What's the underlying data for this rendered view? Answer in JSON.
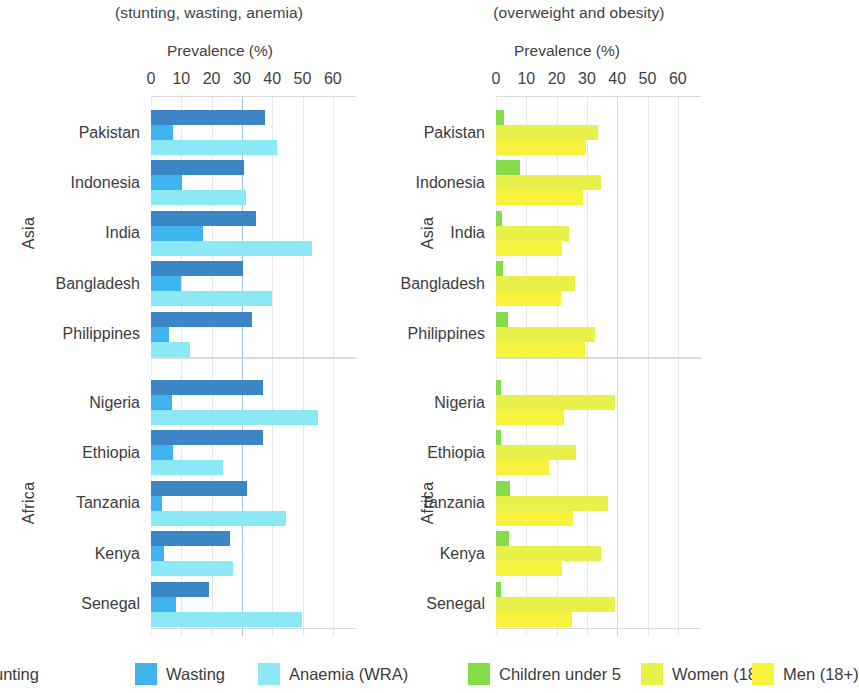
{
  "panels": {
    "left": {
      "subtitle": "(stunting, wasting, anemia)",
      "axis_title": "Prevalence (%)"
    },
    "right": {
      "subtitle": "(overweight and obesity)",
      "axis_title": "Prevalence (%)"
    }
  },
  "ticks": [
    "0",
    "10",
    "20",
    "30",
    "40",
    "50",
    "60"
  ],
  "regions": [
    {
      "label": "Asia",
      "countries": [
        "Pakistan",
        "Indonesia",
        "India",
        "Bangladesh",
        "Philippines"
      ]
    },
    {
      "label": "Africa",
      "countries": [
        "Nigeria",
        "Ethiopia",
        "Tanzania",
        "Kenya",
        "Senegal"
      ]
    }
  ],
  "legend": {
    "left": [
      {
        "name": "Stunting",
        "display": "unting",
        "color": "#3d86c6"
      },
      {
        "name": "Wasting",
        "display": "Wasting",
        "color": "#3fb3ee"
      },
      {
        "name": "Anaemia (WRA)",
        "display": "Anaemia (WRA)",
        "color": "#8de8f6"
      }
    ],
    "right": [
      {
        "name": "Children under 5",
        "display": "Children under 5",
        "color": "#84dd48"
      },
      {
        "name": "Women (18+)",
        "display": "Women (18+)",
        "color": "#e8f04a"
      },
      {
        "name": "Men (18+)",
        "display": "Men (18+)",
        "color": "#f7f23c"
      }
    ]
  },
  "chart_data": [
    {
      "type": "bar",
      "title": "Undernutrition (stunting, wasting, anemia)",
      "orientation": "horizontal",
      "xlabel": "Prevalence (%)",
      "ylabel": "",
      "xlim": [
        0,
        65
      ],
      "xticks": [
        0,
        10,
        20,
        30,
        40,
        50,
        60
      ],
      "grid": true,
      "legend_position": "bottom",
      "categories": [
        "Pakistan",
        "Indonesia",
        "India",
        "Bangladesh",
        "Philippines",
        "Nigeria",
        "Ethiopia",
        "Tanzania",
        "Kenya",
        "Senegal"
      ],
      "series": [
        {
          "name": "Stunting",
          "color": "#3d86c6",
          "values": [
            37.6,
            30.8,
            34.7,
            30.2,
            33.4,
            36.8,
            36.8,
            31.8,
            26.2,
            19.0
          ]
        },
        {
          "name": "Wasting",
          "color": "#3fb3ee",
          "values": [
            7.1,
            10.2,
            17.3,
            9.8,
            5.8,
            6.8,
            7.2,
            3.5,
            4.2,
            8.1
          ]
        },
        {
          "name": "Anaemia (WRA)",
          "color": "#8de8f6",
          "values": [
            41.7,
            31.2,
            53.0,
            39.9,
            12.8,
            55.1,
            23.8,
            44.6,
            27.2,
            49.9
          ]
        }
      ]
    },
    {
      "type": "bar",
      "title": "Overnutrition (overweight and obesity)",
      "orientation": "horizontal",
      "xlabel": "Prevalence (%)",
      "ylabel": "",
      "xlim": [
        0,
        65
      ],
      "xticks": [
        0,
        10,
        20,
        30,
        40,
        50,
        60
      ],
      "grid": true,
      "legend_position": "bottom",
      "categories": [
        "Pakistan",
        "Indonesia",
        "India",
        "Bangladesh",
        "Philippines",
        "Nigeria",
        "Ethiopia",
        "Tanzania",
        "Kenya",
        "Senegal"
      ],
      "series": [
        {
          "name": "Children under 5",
          "color": "#84dd48",
          "values": [
            2.5,
            8.0,
            1.9,
            2.2,
            4.0,
            1.8,
            1.5,
            4.5,
            4.3,
            1.8
          ]
        },
        {
          "name": "Women (18+)",
          "color": "#e8f04a",
          "values": [
            33.6,
            34.6,
            24.0,
            26.2,
            32.8,
            39.2,
            26.4,
            36.8,
            34.7,
            39.4
          ]
        },
        {
          "name": "Men (18+)",
          "color": "#f7f23c",
          "values": [
            29.8,
            28.8,
            21.8,
            21.5,
            29.4,
            22.4,
            17.5,
            25.5,
            21.7,
            25.2
          ]
        }
      ]
    }
  ]
}
